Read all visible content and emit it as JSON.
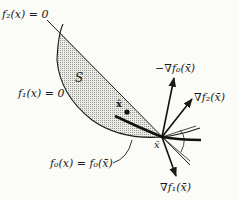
{
  "diagram": {
    "labels": {
      "f2_constraint": "f₂(x) = 0",
      "f1_constraint": "f₁(x) = 0",
      "feasible_set": "S",
      "x_hat": "x̂",
      "level_set": "f₀(x) = f₀(x̄)",
      "x_bar": "x̄",
      "neg_grad_f0": "−∇f₀(x̄)",
      "grad_f2": "∇f₂(x̄)",
      "grad_f1": "∇f₁(x̄)"
    },
    "colors": {
      "ink": "#1a1a1a",
      "feasible_fill": "#d9d9d4",
      "background": "#fbfbf7"
    }
  }
}
